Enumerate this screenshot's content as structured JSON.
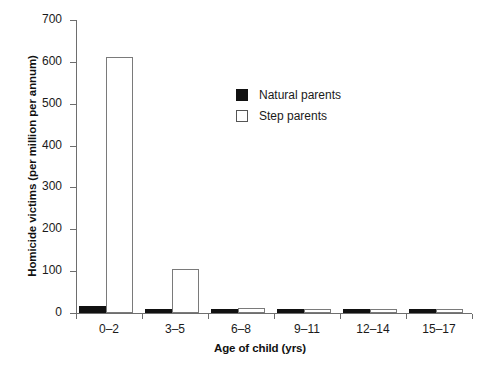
{
  "chart_data": {
    "type": "bar",
    "title": "",
    "xlabel": "Age of child (yrs)",
    "ylabel": "Homicide victims (per million per annum)",
    "categories": [
      "0–2",
      "3–5",
      "6–8",
      "9–11",
      "12–14",
      "15–17"
    ],
    "series": [
      {
        "name": "Natural parents",
        "color": "#111111",
        "values": [
          17,
          10,
          5,
          2,
          1,
          1
        ]
      },
      {
        "name": "Step parents",
        "color": "#ffffff",
        "values": [
          612,
          105,
          11,
          9,
          7,
          8
        ]
      }
    ],
    "ylim": [
      0,
      700
    ],
    "yticks": [
      0,
      100,
      200,
      300,
      400,
      500,
      600,
      700
    ],
    "ytick_labels": [
      "0",
      "100",
      "200",
      "300",
      "400",
      "500",
      "600",
      "700"
    ],
    "grid": false,
    "legend_position": "upper center"
  },
  "legend": {
    "items": [
      {
        "label": "Natural parents",
        "swatch": "filled-black-square"
      },
      {
        "label": "Step parents",
        "swatch": "open-white-square"
      }
    ]
  }
}
